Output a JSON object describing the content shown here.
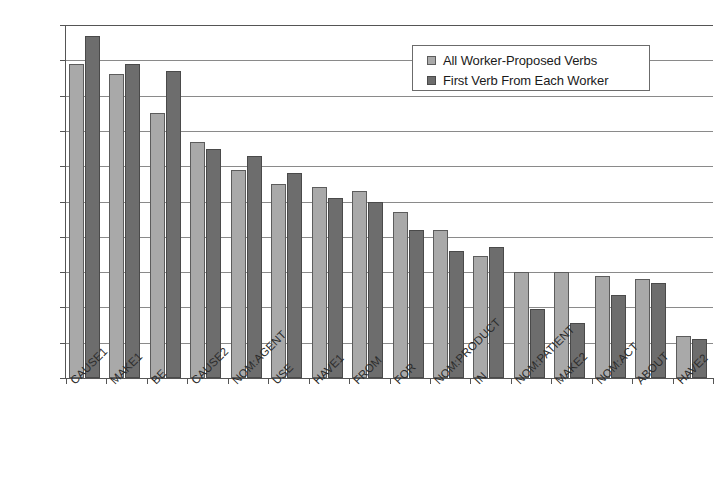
{
  "chart_data": {
    "type": "bar",
    "title": "",
    "xlabel": "",
    "ylabel": "",
    "ylim": [
      0,
      100
    ],
    "ytick_labels": [
      "100%",
      "90%",
      "80%",
      "70%",
      "60%",
      "50%",
      "40%",
      "30%",
      "20%",
      "10%",
      "0%"
    ],
    "ytick_values": [
      100,
      90,
      80,
      70,
      60,
      50,
      40,
      30,
      20,
      10,
      0
    ],
    "grid": true,
    "legend_position": "top-right",
    "categories": [
      "CAUSE1",
      "MAKE1",
      "BE",
      "CAUSE2",
      "NOM:AGENT",
      "USE",
      "HAVE1",
      "FROM",
      "FOR",
      "NOM:PRODUCT",
      "IN",
      "NOM:PATIENT",
      "MAKE2",
      "NOM:ACT",
      "ABOUT",
      "HAVE2"
    ],
    "series": [
      {
        "name": "All Worker-Proposed Verbs",
        "color": "#a9a9a9",
        "values": [
          89,
          86,
          75,
          67,
          59,
          55,
          54,
          53,
          47,
          42,
          34.5,
          30,
          30,
          29,
          28,
          12
        ]
      },
      {
        "name": "First Verb From Each Worker",
        "color": "#6d6d6d",
        "values": [
          97,
          89,
          87,
          65,
          63,
          58,
          51,
          50,
          42,
          36,
          37,
          19.5,
          15.5,
          23.5,
          27,
          11
        ]
      }
    ]
  }
}
